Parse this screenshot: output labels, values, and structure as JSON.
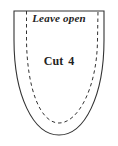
{
  "pattern_piece": {
    "top_label": "Leave open",
    "cut_label": "Cut 4",
    "outline_color": "#333333",
    "seam_color": "#333333"
  }
}
